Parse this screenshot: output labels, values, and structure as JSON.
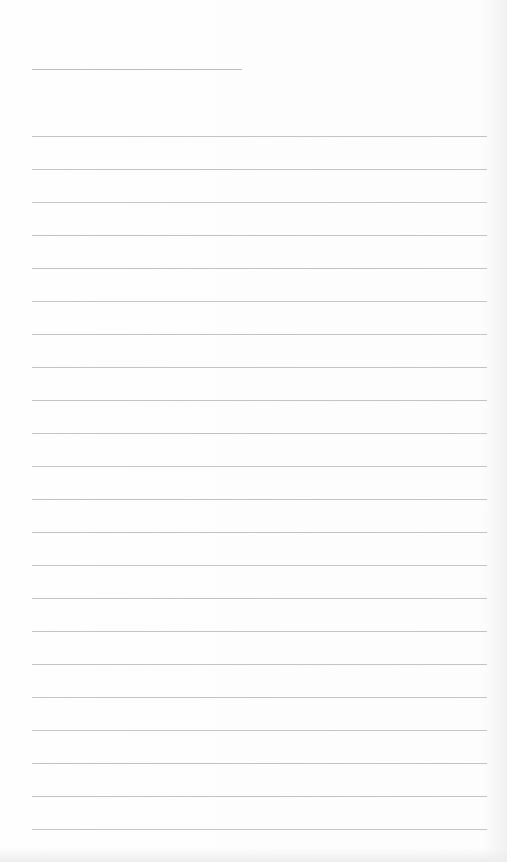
{
  "page": {
    "type": "lined-paper",
    "background": "#fdfdfd",
    "line_color": "#c4c4c4",
    "header_line": {
      "x": 32,
      "y": 69,
      "width": 210
    },
    "ruled_lines": {
      "count": 22,
      "start_y": 136,
      "spacing": 33,
      "x": 32,
      "width": 455
    }
  }
}
